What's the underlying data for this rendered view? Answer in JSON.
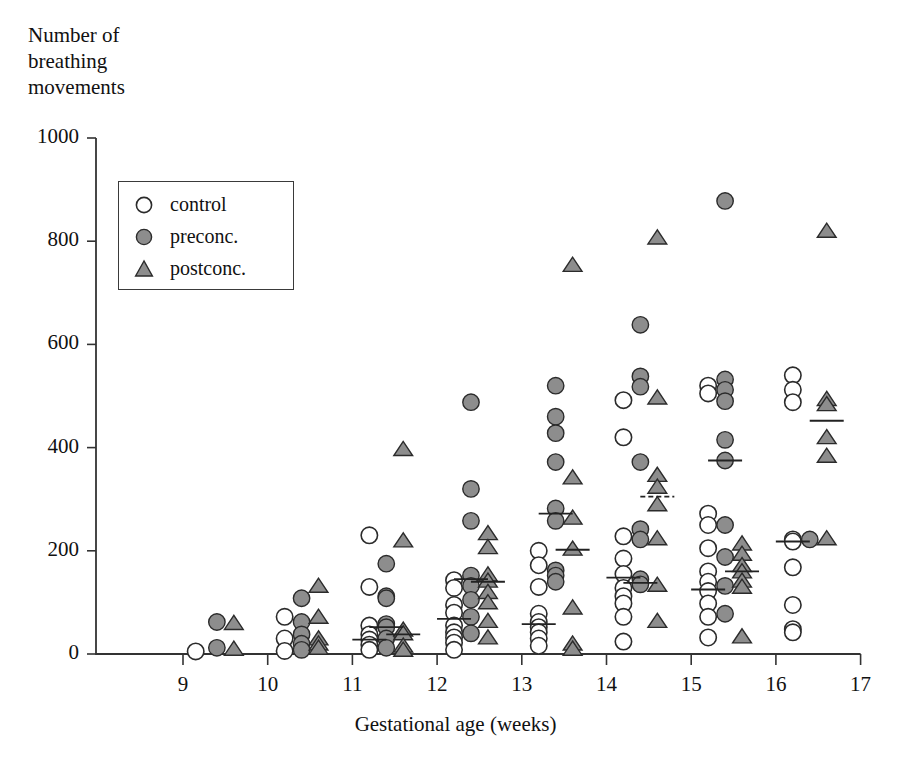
{
  "chart_data": {
    "type": "scatter",
    "title": "",
    "ylabel": "Number of\nbreathing\nmovements",
    "xlabel": "Gestational age (weeks)",
    "xlim": [
      8.6,
      17.0
    ],
    "ylim": [
      0,
      1000
    ],
    "xticks": [
      9,
      10,
      11,
      12,
      13,
      14,
      15,
      16,
      17
    ],
    "yticks": [
      0,
      200,
      400,
      600,
      800,
      1000
    ],
    "xtick_labels": [
      "9",
      "10",
      "11",
      "12",
      "13",
      "14",
      "15",
      "16",
      "17"
    ],
    "ytick_labels": [
      "0",
      "200",
      "400",
      "600",
      "800",
      "1000"
    ],
    "grid": false,
    "legend_position": "upper-left-inside",
    "legend": [
      {
        "label": "control",
        "marker": "open-circle",
        "color": "#ffffff",
        "edge": "#2b2b2b"
      },
      {
        "label": "preconc.",
        "marker": "filled-circle",
        "color": "#8d8d8d",
        "edge": "#2b2b2b"
      },
      {
        "label": "postconc.",
        "marker": "filled-triangle",
        "color": "#8d8d8d",
        "edge": "#2b2b2b"
      }
    ],
    "series": [
      {
        "name": "control",
        "marker": "open-circle",
        "points": [
          [
            9.15,
            5
          ],
          [
            10.2,
            72
          ],
          [
            10.2,
            30
          ],
          [
            10.2,
            6
          ],
          [
            11.2,
            230
          ],
          [
            11.2,
            130
          ],
          [
            11.2,
            55
          ],
          [
            11.2,
            38
          ],
          [
            11.2,
            28
          ],
          [
            11.2,
            18
          ],
          [
            11.2,
            8
          ],
          [
            12.2,
            143
          ],
          [
            12.2,
            128
          ],
          [
            12.2,
            95
          ],
          [
            12.2,
            80
          ],
          [
            12.2,
            55
          ],
          [
            12.2,
            42
          ],
          [
            12.2,
            32
          ],
          [
            12.2,
            22
          ],
          [
            12.2,
            8
          ],
          [
            13.2,
            200
          ],
          [
            13.2,
            172
          ],
          [
            13.2,
            130
          ],
          [
            13.2,
            78
          ],
          [
            13.2,
            62
          ],
          [
            13.2,
            52
          ],
          [
            13.2,
            42
          ],
          [
            13.2,
            30
          ],
          [
            13.2,
            16
          ],
          [
            14.2,
            492
          ],
          [
            14.2,
            420
          ],
          [
            14.2,
            228
          ],
          [
            14.2,
            185
          ],
          [
            14.2,
            155
          ],
          [
            14.2,
            128
          ],
          [
            14.2,
            112
          ],
          [
            14.2,
            98
          ],
          [
            14.2,
            72
          ],
          [
            14.2,
            24
          ],
          [
            15.2,
            520
          ],
          [
            15.2,
            505
          ],
          [
            15.2,
            272
          ],
          [
            15.2,
            250
          ],
          [
            15.2,
            205
          ],
          [
            15.2,
            160
          ],
          [
            15.2,
            140
          ],
          [
            15.2,
            122
          ],
          [
            15.2,
            98
          ],
          [
            15.2,
            72
          ],
          [
            15.2,
            32
          ],
          [
            16.2,
            540
          ],
          [
            16.2,
            512
          ],
          [
            16.2,
            488
          ],
          [
            16.2,
            222
          ],
          [
            16.2,
            218
          ],
          [
            16.2,
            168
          ],
          [
            16.2,
            95
          ],
          [
            16.2,
            48
          ],
          [
            16.2,
            42
          ]
        ]
      },
      {
        "name": "preconc.",
        "marker": "filled-circle",
        "points": [
          [
            9.4,
            62
          ],
          [
            9.4,
            12
          ],
          [
            10.4,
            108
          ],
          [
            10.4,
            62
          ],
          [
            10.4,
            38
          ],
          [
            10.4,
            20
          ],
          [
            10.4,
            8
          ],
          [
            11.4,
            175
          ],
          [
            11.4,
            112
          ],
          [
            11.4,
            108
          ],
          [
            11.4,
            58
          ],
          [
            11.4,
            52
          ],
          [
            11.4,
            30
          ],
          [
            11.4,
            12
          ],
          [
            12.4,
            488
          ],
          [
            12.4,
            320
          ],
          [
            12.4,
            258
          ],
          [
            12.4,
            152
          ],
          [
            12.4,
            132
          ],
          [
            12.4,
            105
          ],
          [
            12.4,
            72
          ],
          [
            12.4,
            40
          ],
          [
            13.4,
            520
          ],
          [
            13.4,
            460
          ],
          [
            13.4,
            428
          ],
          [
            13.4,
            372
          ],
          [
            13.4,
            282
          ],
          [
            13.4,
            258
          ],
          [
            13.4,
            162
          ],
          [
            13.4,
            152
          ],
          [
            13.4,
            140
          ],
          [
            14.4,
            638
          ],
          [
            14.4,
            538
          ],
          [
            14.4,
            518
          ],
          [
            14.4,
            372
          ],
          [
            14.4,
            242
          ],
          [
            14.4,
            222
          ],
          [
            14.4,
            145
          ],
          [
            14.4,
            135
          ],
          [
            15.4,
            878
          ],
          [
            15.4,
            532
          ],
          [
            15.4,
            512
          ],
          [
            15.4,
            490
          ],
          [
            15.4,
            415
          ],
          [
            15.4,
            375
          ],
          [
            15.4,
            250
          ],
          [
            15.4,
            188
          ],
          [
            15.4,
            132
          ],
          [
            15.4,
            78
          ],
          [
            16.4,
            222
          ]
        ]
      },
      {
        "name": "postconc.",
        "marker": "filled-triangle",
        "points": [
          [
            9.6,
            58
          ],
          [
            9.6,
            8
          ],
          [
            10.6,
            130
          ],
          [
            10.6,
            70
          ],
          [
            10.6,
            28
          ],
          [
            10.6,
            18
          ],
          [
            10.6,
            10
          ],
          [
            11.6,
            395
          ],
          [
            11.6,
            218
          ],
          [
            11.6,
            45
          ],
          [
            11.6,
            38
          ],
          [
            11.6,
            14
          ],
          [
            11.6,
            6
          ],
          [
            12.6,
            232
          ],
          [
            12.6,
            205
          ],
          [
            12.6,
            152
          ],
          [
            12.6,
            140
          ],
          [
            12.6,
            118
          ],
          [
            12.6,
            98
          ],
          [
            12.6,
            62
          ],
          [
            12.6,
            30
          ],
          [
            13.6,
            752
          ],
          [
            13.6,
            340
          ],
          [
            13.6,
            262
          ],
          [
            13.6,
            202
          ],
          [
            13.6,
            88
          ],
          [
            13.6,
            18
          ],
          [
            13.6,
            8
          ],
          [
            14.6,
            805
          ],
          [
            14.6,
            495
          ],
          [
            14.6,
            345
          ],
          [
            14.6,
            322
          ],
          [
            14.6,
            288
          ],
          [
            14.6,
            222
          ],
          [
            14.6,
            132
          ],
          [
            14.6,
            62
          ],
          [
            15.6,
            212
          ],
          [
            15.6,
            192
          ],
          [
            15.6,
            170
          ],
          [
            15.6,
            158
          ],
          [
            15.6,
            140
          ],
          [
            15.6,
            128
          ],
          [
            15.6,
            32
          ],
          [
            16.6,
            818
          ],
          [
            16.6,
            492
          ],
          [
            16.6,
            482
          ],
          [
            16.6,
            418
          ],
          [
            16.6,
            382
          ],
          [
            16.6,
            222
          ]
        ]
      }
    ],
    "medians": [
      {
        "group": "control",
        "x": 11.2,
        "y": 28,
        "style": "solid"
      },
      {
        "group": "control",
        "x": 12.2,
        "y": 68,
        "style": "solid"
      },
      {
        "group": "control",
        "x": 13.2,
        "y": 58,
        "style": "solid"
      },
      {
        "group": "control",
        "x": 14.2,
        "y": 148,
        "style": "solid"
      },
      {
        "group": "control",
        "x": 15.2,
        "y": 125,
        "style": "solid"
      },
      {
        "group": "control",
        "x": 16.2,
        "y": 218,
        "style": "solid"
      },
      {
        "group": "preconc.",
        "x": 11.4,
        "y": 52,
        "style": "solid"
      },
      {
        "group": "preconc.",
        "x": 12.4,
        "y": 145,
        "style": "solid"
      },
      {
        "group": "preconc.",
        "x": 13.4,
        "y": 272,
        "style": "solid"
      },
      {
        "group": "preconc.",
        "x": 14.4,
        "y": 138,
        "style": "solid"
      },
      {
        "group": "preconc.",
        "x": 15.4,
        "y": 375,
        "style": "solid"
      },
      {
        "group": "postconc.",
        "x": 11.6,
        "y": 38,
        "style": "solid"
      },
      {
        "group": "postconc.",
        "x": 12.6,
        "y": 140,
        "style": "solid"
      },
      {
        "group": "postconc.",
        "x": 13.6,
        "y": 202,
        "style": "solid"
      },
      {
        "group": "postconc.",
        "x": 14.6,
        "y": 305,
        "style": "dashed"
      },
      {
        "group": "postconc.",
        "x": 15.6,
        "y": 160,
        "style": "solid"
      },
      {
        "group": "postconc.",
        "x": 16.6,
        "y": 452,
        "style": "solid"
      }
    ]
  }
}
